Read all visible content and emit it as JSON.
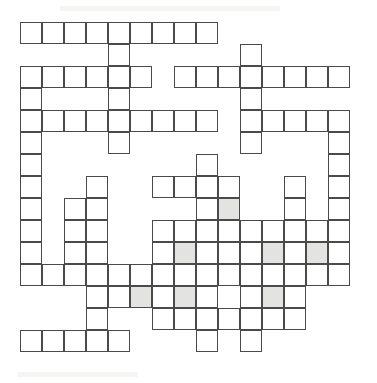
{
  "document": {
    "type": "crossword-grid",
    "title": "Blank crossword puzzle grid",
    "background_color": "#ffffff",
    "cell_border_color": "#4a4a4a",
    "cell_fill_color": "#ffffff",
    "shaded_cell_color": "#e3e3e1"
  },
  "grid": {
    "columns": 15,
    "rows": 15,
    "cell_size": 22,
    "origin_x": 20,
    "origin_y": 22,
    "border_width": 1.6,
    "total_cells": 157,
    "shaded_cells_count": 7,
    "notes": "Cells are addressed [row, column], 1-indexed from the top-left.",
    "cells": [
      {
        "r": 1,
        "c": 1
      },
      {
        "r": 1,
        "c": 2
      },
      {
        "r": 1,
        "c": 3
      },
      {
        "r": 1,
        "c": 4
      },
      {
        "r": 1,
        "c": 5
      },
      {
        "r": 1,
        "c": 6
      },
      {
        "r": 1,
        "c": 7
      },
      {
        "r": 1,
        "c": 8
      },
      {
        "r": 1,
        "c": 9
      },
      {
        "r": 2,
        "c": 5
      },
      {
        "r": 2,
        "c": 11
      },
      {
        "r": 3,
        "c": 1
      },
      {
        "r": 3,
        "c": 2
      },
      {
        "r": 3,
        "c": 3
      },
      {
        "r": 3,
        "c": 4
      },
      {
        "r": 3,
        "c": 5
      },
      {
        "r": 3,
        "c": 6
      },
      {
        "r": 3,
        "c": 8
      },
      {
        "r": 3,
        "c": 9
      },
      {
        "r": 3,
        "c": 10
      },
      {
        "r": 3,
        "c": 11
      },
      {
        "r": 3,
        "c": 12
      },
      {
        "r": 3,
        "c": 13
      },
      {
        "r": 3,
        "c": 14
      },
      {
        "r": 3,
        "c": 15
      },
      {
        "r": 4,
        "c": 1
      },
      {
        "r": 4,
        "c": 5
      },
      {
        "r": 4,
        "c": 11
      },
      {
        "r": 5,
        "c": 1
      },
      {
        "r": 5,
        "c": 2
      },
      {
        "r": 5,
        "c": 3
      },
      {
        "r": 5,
        "c": 4
      },
      {
        "r": 5,
        "c": 5
      },
      {
        "r": 5,
        "c": 6
      },
      {
        "r": 5,
        "c": 7
      },
      {
        "r": 5,
        "c": 8
      },
      {
        "r": 5,
        "c": 9
      },
      {
        "r": 5,
        "c": 11
      },
      {
        "r": 5,
        "c": 12
      },
      {
        "r": 5,
        "c": 13
      },
      {
        "r": 5,
        "c": 14
      },
      {
        "r": 5,
        "c": 15
      },
      {
        "r": 6,
        "c": 1
      },
      {
        "r": 6,
        "c": 5
      },
      {
        "r": 6,
        "c": 11
      },
      {
        "r": 6,
        "c": 15
      },
      {
        "r": 7,
        "c": 1
      },
      {
        "r": 7,
        "c": 9
      },
      {
        "r": 7,
        "c": 15
      },
      {
        "r": 8,
        "c": 1
      },
      {
        "r": 8,
        "c": 4
      },
      {
        "r": 8,
        "c": 7
      },
      {
        "r": 8,
        "c": 8
      },
      {
        "r": 8,
        "c": 9
      },
      {
        "r": 8,
        "c": 10
      },
      {
        "r": 8,
        "c": 13
      },
      {
        "r": 8,
        "c": 15
      },
      {
        "r": 9,
        "c": 1
      },
      {
        "r": 9,
        "c": 3
      },
      {
        "r": 9,
        "c": 4
      },
      {
        "r": 9,
        "c": 9
      },
      {
        "r": 9,
        "c": 10,
        "shaded": true
      },
      {
        "r": 9,
        "c": 13
      },
      {
        "r": 9,
        "c": 15
      },
      {
        "r": 10,
        "c": 1
      },
      {
        "r": 10,
        "c": 3
      },
      {
        "r": 10,
        "c": 4
      },
      {
        "r": 10,
        "c": 7
      },
      {
        "r": 10,
        "c": 8
      },
      {
        "r": 10,
        "c": 9
      },
      {
        "r": 10,
        "c": 10
      },
      {
        "r": 10,
        "c": 11
      },
      {
        "r": 10,
        "c": 12
      },
      {
        "r": 10,
        "c": 13
      },
      {
        "r": 10,
        "c": 14
      },
      {
        "r": 10,
        "c": 15
      },
      {
        "r": 11,
        "c": 1
      },
      {
        "r": 11,
        "c": 3
      },
      {
        "r": 11,
        "c": 4
      },
      {
        "r": 11,
        "c": 7
      },
      {
        "r": 11,
        "c": 8,
        "shaded": true
      },
      {
        "r": 11,
        "c": 9
      },
      {
        "r": 11,
        "c": 10
      },
      {
        "r": 11,
        "c": 11
      },
      {
        "r": 11,
        "c": 12,
        "shaded": true
      },
      {
        "r": 11,
        "c": 13
      },
      {
        "r": 11,
        "c": 14,
        "shaded": true
      },
      {
        "r": 11,
        "c": 15
      },
      {
        "r": 12,
        "c": 1
      },
      {
        "r": 12,
        "c": 2
      },
      {
        "r": 12,
        "c": 3
      },
      {
        "r": 12,
        "c": 4
      },
      {
        "r": 12,
        "c": 5
      },
      {
        "r": 12,
        "c": 6
      },
      {
        "r": 12,
        "c": 7
      },
      {
        "r": 12,
        "c": 8
      },
      {
        "r": 12,
        "c": 9
      },
      {
        "r": 12,
        "c": 10
      },
      {
        "r": 12,
        "c": 11
      },
      {
        "r": 12,
        "c": 12
      },
      {
        "r": 12,
        "c": 13
      },
      {
        "r": 12,
        "c": 14
      },
      {
        "r": 12,
        "c": 15
      },
      {
        "r": 13,
        "c": 4
      },
      {
        "r": 13,
        "c": 5
      },
      {
        "r": 13,
        "c": 6,
        "shaded": true
      },
      {
        "r": 13,
        "c": 7
      },
      {
        "r": 13,
        "c": 8,
        "shaded": true
      },
      {
        "r": 13,
        "c": 9
      },
      {
        "r": 13,
        "c": 11
      },
      {
        "r": 13,
        "c": 12,
        "shaded": true
      },
      {
        "r": 13,
        "c": 13
      },
      {
        "r": 14,
        "c": 4
      },
      {
        "r": 14,
        "c": 7
      },
      {
        "r": 14,
        "c": 8
      },
      {
        "r": 14,
        "c": 9
      },
      {
        "r": 14,
        "c": 10
      },
      {
        "r": 14,
        "c": 11
      },
      {
        "r": 14,
        "c": 12
      },
      {
        "r": 14,
        "c": 13
      },
      {
        "r": 15,
        "c": 1
      },
      {
        "r": 15,
        "c": 2
      },
      {
        "r": 15,
        "c": 3
      },
      {
        "r": 15,
        "c": 4
      },
      {
        "r": 15,
        "c": 5
      },
      {
        "r": 15,
        "c": 9
      },
      {
        "r": 15,
        "c": 11
      }
    ]
  }
}
